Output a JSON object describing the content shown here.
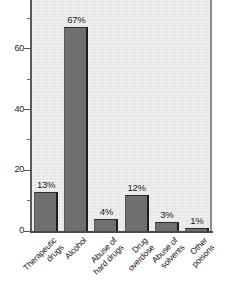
{
  "chart_data": {
    "type": "bar",
    "title": "",
    "subtitle": "",
    "xlabel": "",
    "ylabel": "",
    "categories": [
      "Therapeutic\ndrugs",
      "Alcohol",
      "Abuse of\nhard drugs",
      "Drug\noverdose",
      "Abuse of\nsolvents",
      "Other\npoisons"
    ],
    "values": [
      13,
      67,
      4,
      12,
      3,
      1
    ],
    "data_labels": [
      "13%",
      "67%",
      "4%",
      "12%",
      "3%",
      "1%"
    ],
    "ylim": [
      0,
      80
    ],
    "ytick_labels": [
      "0",
      "20",
      "40",
      "60",
      "80"
    ],
    "ytick_values": [
      0,
      20,
      40,
      60,
      80
    ],
    "yminor_tick_values": [
      10,
      30,
      50,
      70
    ],
    "grid": false,
    "legend": false,
    "orientation": "vertical",
    "units": "percent"
  },
  "colors": {
    "bar_fill": "#6f6f6f",
    "bar_edge": "#1d1d1d",
    "plot_background": "#e9e9e9",
    "figure_background": "#ffffff",
    "axis": "#4a4a4a",
    "text": "#1b1b1b"
  }
}
